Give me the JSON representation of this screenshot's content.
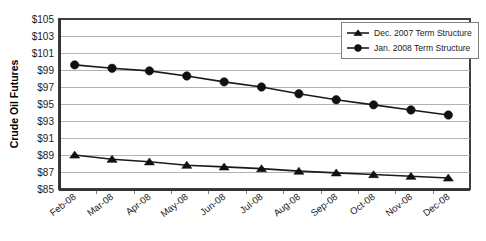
{
  "chart_data": {
    "type": "line",
    "title": "",
    "xlabel": "",
    "ylabel": "Crude Oil Futures",
    "ylim": [
      85,
      105
    ],
    "ytick_values": [
      85,
      87,
      89,
      91,
      93,
      95,
      97,
      99,
      101,
      103,
      105
    ],
    "ytick_labels": [
      "$85",
      "$87",
      "$89",
      "$91",
      "$93",
      "$95",
      "$97",
      "$99",
      "$101",
      "$103",
      "$105"
    ],
    "categories": [
      "Feb-08",
      "Mar-08",
      "Apr-08",
      "May-08",
      "Jun-08",
      "Jul-08",
      "Aug-08",
      "Sep-08",
      "Oct-08",
      "Nov-08",
      "Dec-08"
    ],
    "grid": "horizontal",
    "legend_position": "top-right",
    "series": [
      {
        "name": "Dec. 2007 Term Structure",
        "marker": "triangle",
        "color": "#111111",
        "values": [
          89.0,
          88.5,
          88.2,
          87.8,
          87.6,
          87.4,
          87.1,
          86.9,
          86.7,
          86.5,
          86.3
        ]
      },
      {
        "name": "Jan. 2008 Term Structure",
        "marker": "circle",
        "color": "#111111",
        "values": [
          99.6,
          99.2,
          98.9,
          98.3,
          97.6,
          97.0,
          96.2,
          95.5,
          94.9,
          94.3,
          93.7
        ]
      }
    ]
  },
  "legend": {
    "entries": [
      {
        "label": "Dec. 2007 Term Structure",
        "marker": "triangle"
      },
      {
        "label": "Jan. 2008 Term Structure",
        "marker": "circle"
      }
    ]
  }
}
